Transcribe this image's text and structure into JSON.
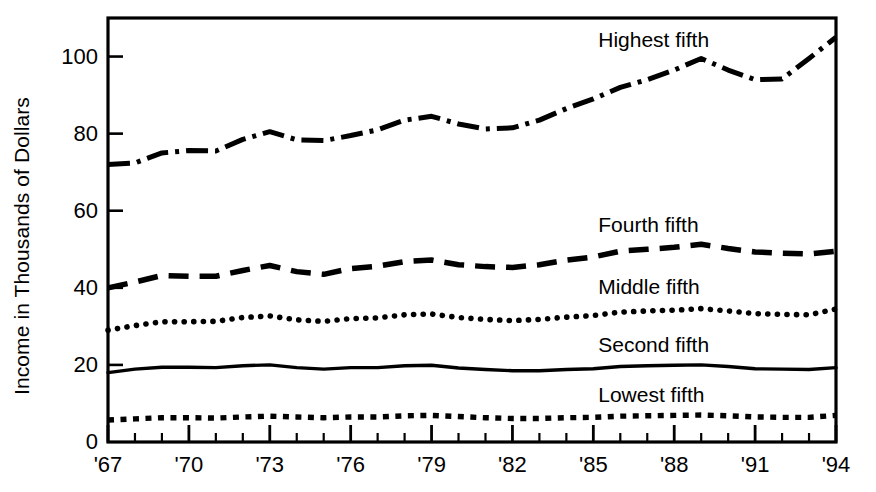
{
  "chart_data": {
    "type": "line",
    "title": "",
    "xlabel": "",
    "ylabel": "Income in Thousands of Dollars",
    "xlim": [
      1967,
      1994
    ],
    "ylim": [
      0,
      110
    ],
    "yticks": [
      0,
      20,
      40,
      60,
      80,
      100
    ],
    "ytick_labels": [
      "0",
      "20",
      "40",
      "60",
      "80",
      "100"
    ],
    "xticks": [
      1967,
      1970,
      1973,
      1976,
      1979,
      1982,
      1985,
      1988,
      1991,
      1994
    ],
    "xtick_labels": [
      "'67",
      "'70",
      "'73",
      "'76",
      "'79",
      "'82",
      "'85",
      "'88",
      "'91",
      "'94"
    ],
    "minor_xtick_interval": 1,
    "grid": false,
    "legend_position": "inline-right",
    "x": [
      1967,
      1968,
      1969,
      1970,
      1971,
      1972,
      1973,
      1974,
      1975,
      1976,
      1977,
      1978,
      1979,
      1980,
      1981,
      1982,
      1983,
      1984,
      1985,
      1986,
      1987,
      1988,
      1989,
      1990,
      1991,
      1992,
      1993,
      1994
    ],
    "series": [
      {
        "name": "Highest fifth",
        "label": "Highest fifth",
        "linestyle": "dashdot",
        "color": "#000000",
        "values": [
          72.0,
          72.4,
          75.0,
          75.6,
          75.5,
          78.5,
          80.5,
          78.4,
          78.2,
          79.5,
          81.0,
          83.5,
          84.5,
          82.5,
          81.2,
          81.5,
          83.5,
          86.5,
          89.0,
          92.0,
          94.0,
          96.5,
          99.5,
          96.5,
          94.0,
          94.2,
          99.5,
          105.0
        ]
      },
      {
        "name": "Fourth fifth",
        "label": "Fourth fifth",
        "linestyle": "dashed",
        "color": "#000000",
        "values": [
          40.0,
          41.5,
          43.2,
          43.0,
          43.0,
          44.5,
          45.8,
          44.2,
          43.5,
          45.0,
          45.6,
          46.8,
          47.2,
          46.0,
          45.5,
          45.3,
          46.0,
          47.2,
          48.0,
          49.5,
          50.0,
          50.5,
          51.3,
          50.2,
          49.3,
          49.0,
          48.8,
          49.5
        ]
      },
      {
        "name": "Middle fifth",
        "label": "Middle fifth",
        "linestyle": "dotted",
        "color": "#000000",
        "values": [
          29.0,
          30.2,
          31.2,
          31.2,
          31.3,
          32.3,
          32.7,
          31.7,
          31.3,
          32.0,
          32.2,
          33.0,
          33.2,
          32.3,
          31.8,
          31.5,
          31.8,
          32.4,
          32.8,
          33.7,
          34.0,
          34.2,
          34.6,
          34.0,
          33.3,
          33.1,
          33.0,
          34.5
        ]
      },
      {
        "name": "Second fifth",
        "label": "Second fifth",
        "linestyle": "solid",
        "color": "#000000",
        "values": [
          18.0,
          18.9,
          19.4,
          19.4,
          19.3,
          19.8,
          20.0,
          19.3,
          18.9,
          19.3,
          19.3,
          19.8,
          19.9,
          19.2,
          18.8,
          18.5,
          18.5,
          18.8,
          19.0,
          19.6,
          19.8,
          19.9,
          20.0,
          19.6,
          19.0,
          18.9,
          18.8,
          19.3
        ]
      },
      {
        "name": "Lowest fifth",
        "label": "Lowest fifth",
        "linestyle": "dotted-square",
        "color": "#000000",
        "values": [
          5.7,
          6.0,
          6.3,
          6.3,
          6.2,
          6.5,
          6.7,
          6.5,
          6.3,
          6.5,
          6.5,
          6.8,
          6.9,
          6.6,
          6.3,
          6.1,
          6.1,
          6.3,
          6.4,
          6.7,
          6.8,
          6.9,
          7.0,
          6.8,
          6.5,
          6.4,
          6.4,
          6.9
        ]
      }
    ],
    "annotations": [
      {
        "text": "Highest fifth",
        "x": 1988,
        "y": 104
      },
      {
        "text": "Fourth fifth",
        "x": 1988,
        "y": 56
      },
      {
        "text": "Middle fifth",
        "x": 1988,
        "y": 40
      },
      {
        "text": "Second fifth",
        "x": 1988,
        "y": 25
      },
      {
        "text": "Lowest fifth",
        "x": 1988,
        "y": 12
      }
    ]
  }
}
